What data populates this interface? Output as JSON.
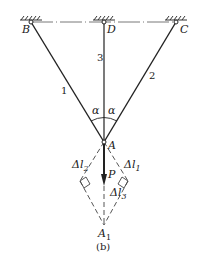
{
  "diagram": {
    "caption": "(b)",
    "points": {
      "B": "B",
      "D": "D",
      "C": "C",
      "A": "A",
      "A1": "A",
      "A1_sub": "1"
    },
    "rods": {
      "rod1": "1",
      "rod2": "2",
      "rod3": "3"
    },
    "angles": {
      "left": "α",
      "right": "α"
    },
    "load": "P",
    "deformations": {
      "dl1": "Δl",
      "dl1_sub": "1",
      "dl2": "Δl",
      "dl2_sub": "2",
      "dl3": "Δl",
      "dl3_sub": "3"
    },
    "colors": {
      "line": "#222222",
      "dashed": "#555555"
    }
  }
}
